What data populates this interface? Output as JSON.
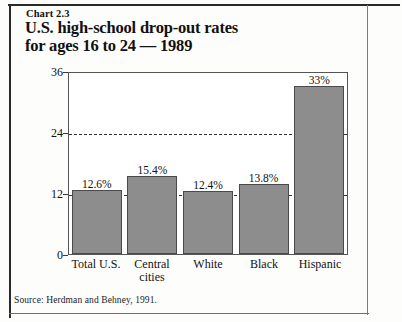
{
  "figure": {
    "chart_number": "Chart 2.3",
    "title": "U.S. high-school drop-out rates\nfor ages 16 to 24 — 1989",
    "source": "Source: Herdman and Behney, 1991."
  },
  "chart_data": {
    "type": "bar",
    "title": "U.S. high-school drop-out rates for ages 16 to 24 — 1989",
    "categories": [
      "Total U.S.",
      "Central\ncities",
      "White",
      "Black",
      "Hispanic"
    ],
    "values": [
      12.6,
      15.4,
      12.4,
      13.8,
      33
    ],
    "data_labels": [
      "12.6%",
      "15.4%",
      "12.4%",
      "13.8%",
      "33%"
    ],
    "xlabel": "",
    "ylabel": "",
    "ylim": [
      0,
      36
    ],
    "yticks": [
      0,
      12,
      24,
      36
    ],
    "ytick_labels": [
      "0",
      "12",
      "24",
      "36"
    ],
    "gridlines": [
      12,
      24
    ],
    "grid": true,
    "legend": false,
    "bar_color": "#8d8d8d",
    "bar_edge_color": "#4a4a4a"
  }
}
